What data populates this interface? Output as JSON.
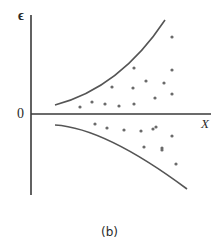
{
  "figure": {
    "caption": "(b)",
    "y_axis_label": "ϵ",
    "x_axis_label": "X",
    "origin_label": "0",
    "colors": {
      "axis": "#3a3a3a",
      "curve": "#555555",
      "dot": "#6a6a6a",
      "text": "#2a2a2a"
    },
    "axes": {
      "origin": [
        31,
        114
      ],
      "y_top": 15,
      "y_bottom": 195,
      "x_right": 211
    },
    "upper_curve_path": "M55,105 Q120,88 165,20",
    "lower_curve_path": "M55,125 Q105,128 187,189",
    "dots_above": [
      [
        80,
        107
      ],
      [
        92,
        102
      ],
      [
        105,
        104
      ],
      [
        119,
        106
      ],
      [
        134,
        104
      ],
      [
        133,
        88
      ],
      [
        134,
        68
      ],
      [
        112,
        87
      ],
      [
        146,
        81
      ],
      [
        155,
        98
      ],
      [
        164,
        83
      ],
      [
        172,
        70
      ],
      [
        172,
        94
      ],
      [
        172,
        37
      ]
    ],
    "dots_below": [
      [
        95,
        124
      ],
      [
        107,
        128
      ],
      [
        124,
        130
      ],
      [
        141,
        131
      ],
      [
        153,
        129
      ],
      [
        156,
        127
      ],
      [
        172,
        136
      ],
      [
        144,
        147
      ],
      [
        162,
        148
      ],
      [
        162,
        150
      ],
      [
        176,
        164
      ]
    ]
  }
}
